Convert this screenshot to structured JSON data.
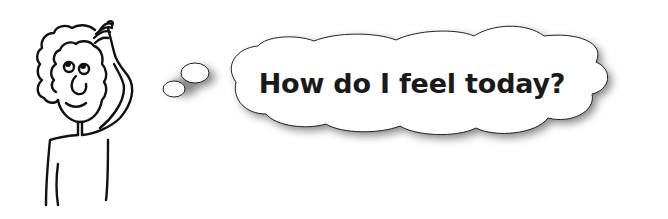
{
  "illustration": {
    "figure": "person-scratching-head",
    "thought_bubble": {
      "text": "How do I feel today?"
    }
  },
  "colors": {
    "background": "#ffffff",
    "line": "#111111",
    "bubble_fill": "#ffffff",
    "shadow": "#8a8a8a"
  }
}
